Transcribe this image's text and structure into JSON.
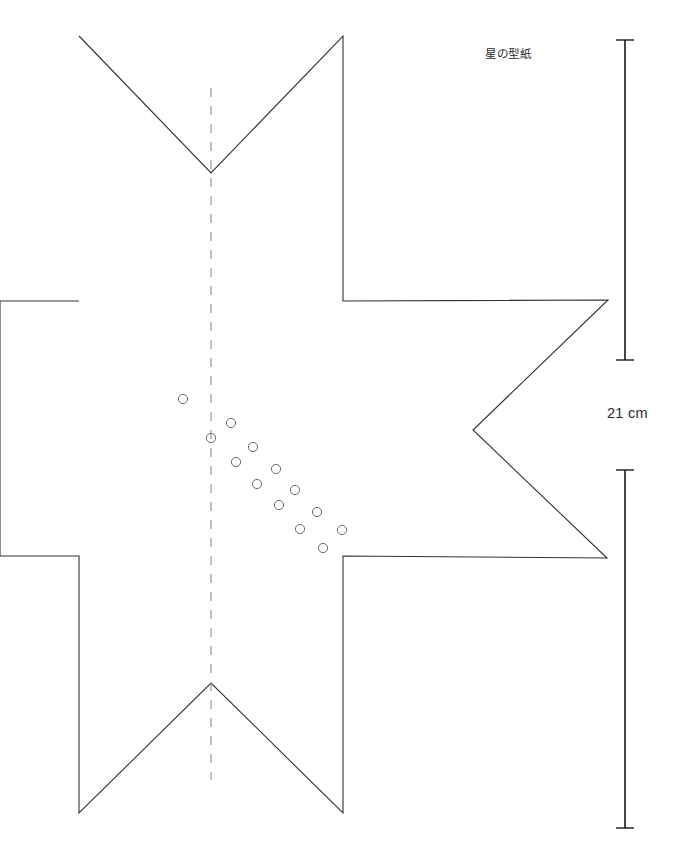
{
  "document": {
    "title": "星の型紙",
    "title_icon": "star-pattern-template",
    "background_color": "#ffffff",
    "width": 686,
    "height": 846
  },
  "annotations": {
    "title_label": "星の型紙",
    "measurement_label": "21 cm"
  },
  "drawing": {
    "stroke_color": "#333333",
    "stroke_width": 1.1,
    "fold_line_color": "#9a9a9a",
    "hole_stroke_color": "#6b6b6b",
    "dimension_color": "#1a1a1a",
    "star_outline_points": [
      [
        79,
        36
      ],
      [
        211,
        173
      ],
      [
        343,
        36
      ],
      [
        343,
        301
      ],
      [
        608,
        300
      ],
      [
        473,
        430
      ],
      [
        607,
        558
      ],
      [
        343,
        556
      ],
      [
        343,
        813
      ],
      [
        211,
        683
      ],
      [
        79,
        813
      ],
      [
        79,
        556
      ],
      [
        0,
        556
      ],
      [
        0,
        301
      ],
      [
        79,
        301
      ]
    ],
    "fold_line": {
      "x": 211,
      "y_start": 88,
      "y_end": 780,
      "dash": "9 9"
    },
    "holes_radius": 4.6,
    "holes": [
      [
        183,
        399
      ],
      [
        231,
        423
      ],
      [
        211,
        438
      ],
      [
        253,
        447
      ],
      [
        236,
        462
      ],
      [
        276,
        469
      ],
      [
        257,
        484
      ],
      [
        295,
        490
      ],
      [
        279,
        505
      ],
      [
        317,
        512
      ],
      [
        300,
        529
      ],
      [
        342,
        530
      ],
      [
        323,
        548
      ]
    ],
    "dimension_line": {
      "x": 625,
      "cap_half_width": 9,
      "segments": [
        {
          "y_start": 40,
          "y_end": 360
        },
        {
          "y_start": 470,
          "y_end": 828
        }
      ]
    }
  }
}
